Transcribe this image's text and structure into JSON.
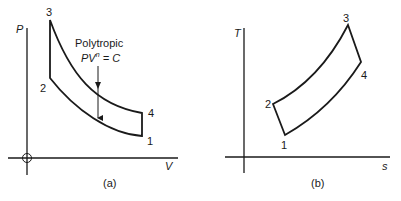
{
  "panel_a": {
    "caption": "(a)",
    "y_axis_label": "P",
    "x_axis_label": "V",
    "points": {
      "p1": "1",
      "p2": "2",
      "p3": "3",
      "p4": "4"
    },
    "annotation_line1": "Polytropic",
    "annotation_PV": "PV",
    "annotation_exp": "n",
    "annotation_eq": " = C"
  },
  "panel_b": {
    "caption": "(b)",
    "y_axis_label": "T",
    "x_axis_label": "s",
    "points": {
      "p1": "1",
      "p2": "2",
      "p3": "3",
      "p4": "4"
    }
  },
  "colors": {
    "line": "#1a1a1a",
    "background": "#ffffff"
  }
}
